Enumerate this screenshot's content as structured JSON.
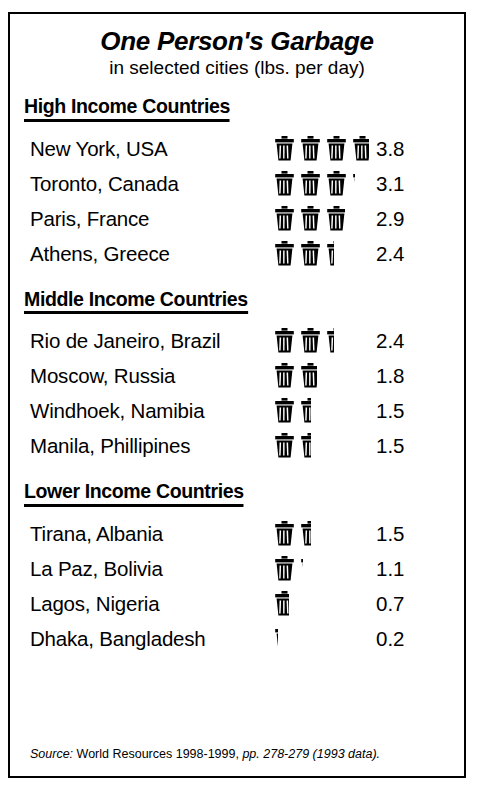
{
  "chart_data": {
    "type": "bar",
    "subtype": "pictogram",
    "title": "One Person's Garbage",
    "subtitle": "in selected cities (lbs. per day)",
    "xlabel": "",
    "ylabel": "lbs. per day",
    "unit_label": "lbs. per day",
    "icon": "trash-can-icon",
    "icon_unit_value": 1,
    "categories": [
      "New York, USA",
      "Toronto, Canada",
      "Paris, France",
      "Athens, Greece",
      "Rio de Janeiro, Brazil",
      "Moscow, Russia",
      "Windhoek, Namibia",
      "Manila, Phillipines",
      "Tirana, Albania",
      "La Paz, Bolivia",
      "Lagos, Nigeria",
      "Dhaka, Bangladesh"
    ],
    "values": [
      3.8,
      3.1,
      2.9,
      2.4,
      2.4,
      1.8,
      1.5,
      1.5,
      1.5,
      1.1,
      0.7,
      0.2
    ],
    "groups": [
      {
        "label": "High Income Countries",
        "categories": [
          "New York, USA",
          "Toronto, Canada",
          "Paris, France",
          "Athens, Greece"
        ],
        "values": [
          3.8,
          3.1,
          2.9,
          2.4
        ]
      },
      {
        "label": "Middle Income Countries",
        "categories": [
          "Rio de Janeiro, Brazil",
          "Moscow, Russia",
          "Windhoek, Namibia",
          "Manila, Phillipines"
        ],
        "values": [
          2.4,
          1.8,
          1.5,
          1.5
        ]
      },
      {
        "label": "Lower Income Countries",
        "categories": [
          "Tirana, Albania",
          "La Paz, Bolivia",
          "Lagos, Nigeria",
          "Dhaka, Bangladesh"
        ],
        "values": [
          1.5,
          1.1,
          0.7,
          0.2
        ]
      }
    ],
    "grid": false,
    "legend": "none",
    "source": "Source: World Resources 1998-1999, pp. 278-279 (1993 data)."
  },
  "header": {
    "title": "One Person's Garbage",
    "subtitle": "in selected cities (lbs. per day)"
  },
  "sections": [
    {
      "heading": "High Income Countries",
      "rows": [
        {
          "city": "New York, USA",
          "value": "3.8"
        },
        {
          "city": "Toronto, Canada",
          "value": "3.1"
        },
        {
          "city": "Paris, France",
          "value": "2.9"
        },
        {
          "city": "Athens, Greece",
          "value": "2.4"
        }
      ]
    },
    {
      "heading": "Middle Income Countries",
      "rows": [
        {
          "city": "Rio de Janeiro, Brazil",
          "value": "2.4"
        },
        {
          "city": "Moscow, Russia",
          "value": "1.8"
        },
        {
          "city": "Windhoek, Namibia",
          "value": "1.5"
        },
        {
          "city": "Manila, Phillipines",
          "value": "1.5"
        }
      ]
    },
    {
      "heading": "Lower Income Countries",
      "rows": [
        {
          "city": "Tirana, Albania",
          "value": "1.5"
        },
        {
          "city": "La Paz, Bolivia",
          "value": "1.1"
        },
        {
          "city": "Lagos, Nigeria",
          "value": "0.7"
        },
        {
          "city": "Dhaka, Bangladesh",
          "value": "0.2"
        }
      ]
    }
  ],
  "footer": {
    "source_prefix": "Source:",
    "source_main": " World Resources 1998-1999,",
    "source_pages": " pp. 278-279 (1993 data)."
  }
}
